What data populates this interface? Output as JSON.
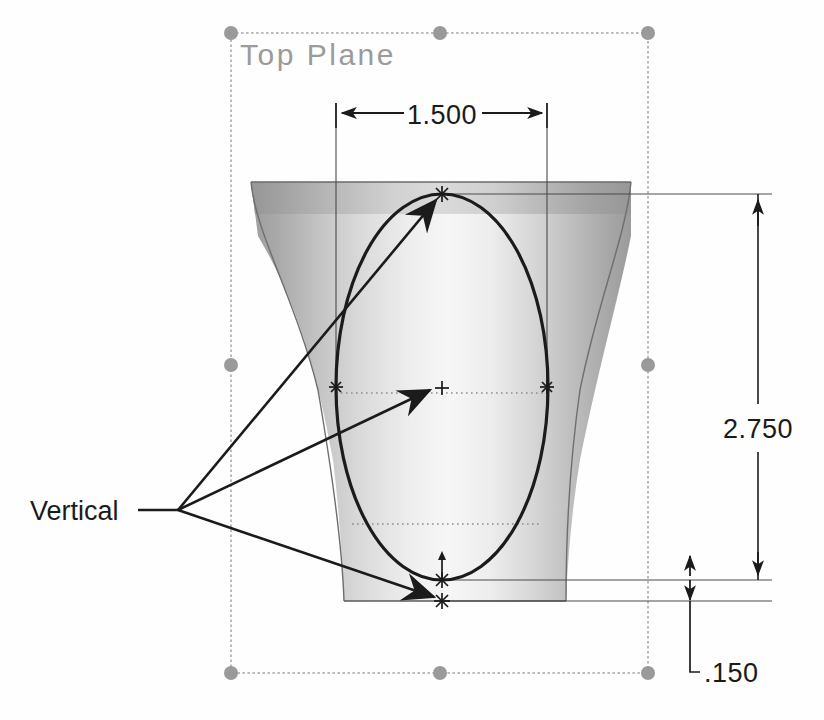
{
  "view": {
    "background_color": "#fefefe",
    "model_name": "revolved-cup-body"
  },
  "plane": {
    "label": "Top Plane",
    "label_color": "#9b9b9b",
    "border_color": "#a8a8a8",
    "handle_color": "#9a9a9a",
    "handle_count": 8,
    "bounds": {
      "x": 231,
      "y": 33,
      "width": 417,
      "height": 640
    }
  },
  "solid": {
    "fill_light": "#f4f4f4",
    "fill_mid": "#d8d8d8",
    "fill_dark": "#9d9d9d",
    "outline_color": "#5a5a5a",
    "top_y": 182,
    "bottom_y": 601
  },
  "sketch": {
    "entity": "ellipse",
    "curve_color": "#1b1b1b",
    "center_marker": "plus-cross",
    "center": {
      "x": 442,
      "y": 388
    },
    "vertices": [
      {
        "name": "top-vertex",
        "x": 442,
        "y": 194,
        "marker": "star"
      },
      {
        "name": "left-vertex",
        "x": 336,
        "y": 387,
        "marker": "star"
      },
      {
        "name": "right-vertex",
        "x": 547,
        "y": 387,
        "marker": "star"
      },
      {
        "name": "bottom-vertex",
        "x": 442,
        "y": 580,
        "marker": "star"
      },
      {
        "name": "base-point",
        "x": 442,
        "y": 601,
        "marker": "star"
      }
    ]
  },
  "annotations": {
    "relation_label": "Vertical",
    "leader_color": "#1b1b1b",
    "junction": {
      "x": 178,
      "y": 510
    },
    "targets": [
      {
        "name": "top-vertex",
        "x": 442,
        "y": 196
      },
      {
        "name": "center-point",
        "x": 437,
        "y": 389
      },
      {
        "name": "base-point",
        "x": 440,
        "y": 598
      }
    ]
  },
  "dimensions": [
    {
      "id": "width-dim",
      "name": "horizontal-width-dimension",
      "value": "1.500",
      "orientation": "horizontal",
      "dim_line_y": 113,
      "from_x": 336,
      "to_x": 547,
      "text_x": 442,
      "text_y": 122,
      "arrow_style": "outside",
      "color": "#1b1b1b"
    },
    {
      "id": "height-dim",
      "name": "vertical-height-dimension",
      "value": "2.750",
      "orientation": "vertical",
      "dim_line_x": 758,
      "from_y": 195,
      "to_y": 580,
      "text_x": 728,
      "text_y": 430,
      "arrow_style": "inside",
      "color": "#1b1b1b"
    },
    {
      "id": "offset-dim",
      "name": "base-offset-dimension",
      "value": ".150",
      "orientation": "vertical-leader",
      "dim_line_x": 690,
      "from_y": 580,
      "to_y": 601,
      "text_x": 712,
      "text_y": 679,
      "arrow_style": "inside",
      "color": "#1b1b1b"
    }
  ],
  "construction_lines": {
    "color": "#5a5a5a",
    "dotted_color": "#8d8d8d",
    "items": [
      {
        "name": "left-extension-line",
        "x1": 336,
        "y1": 103,
        "x2": 336,
        "y2": 400
      },
      {
        "name": "right-extension-line",
        "x1": 547,
        "y1": 103,
        "x2": 547,
        "y2": 400
      },
      {
        "name": "top-extension-line",
        "x1": 442,
        "y1": 194,
        "x2": 772,
        "y2": 194
      },
      {
        "name": "bottom-extension-line",
        "x1": 442,
        "y1": 580,
        "x2": 772,
        "y2": 580
      },
      {
        "name": "base-extension-line",
        "x1": 442,
        "y1": 601,
        "x2": 772,
        "y2": 601
      },
      {
        "name": "upper-dotted-line",
        "x1": 336,
        "y1": 393,
        "x2": 547,
        "y2": 393
      },
      {
        "name": "lower-dotted-line",
        "x1": 352,
        "y1": 524,
        "x2": 540,
        "y2": 524
      }
    ]
  }
}
